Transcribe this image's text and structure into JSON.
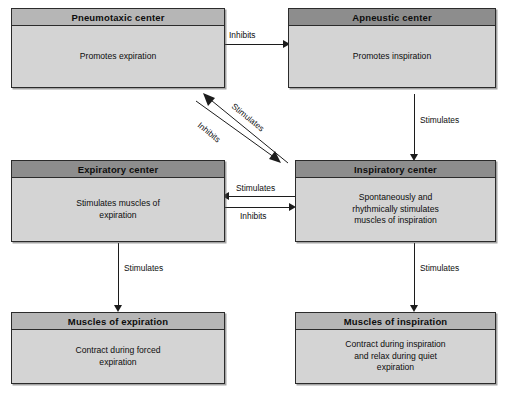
{
  "diagram": {
    "colors": {
      "box_fill": "#d4d4d4",
      "header_light": "#b6b6b6",
      "header_dark": "#8d8d8d",
      "border": "#2b2b2b",
      "line": "#1c1c1c",
      "background": "#ffffff"
    },
    "nodes": [
      {
        "id": "pneumotaxic",
        "title": "Pneumotaxic center",
        "body": "Promotes expiration",
        "header_shade": "light"
      },
      {
        "id": "apneustic",
        "title": "Apneustic center",
        "body": "Promotes inspiration",
        "header_shade": "dark"
      },
      {
        "id": "expiratory",
        "title": "Expiratory center",
        "body": "Stimulates muscles of\nexpiration",
        "header_shade": "dark"
      },
      {
        "id": "inspiratory",
        "title": "Inspiratory center",
        "body": "Spontaneously and\nrhythmically stimulates\nmuscles of inspiration",
        "header_shade": "dark"
      },
      {
        "id": "muscles-expiration",
        "title": "Muscles of expiration",
        "body": "Contract during forced\nexpiration",
        "header_shade": "light"
      },
      {
        "id": "muscles-inspiration",
        "title": "Muscles of inspiration",
        "body": "Contract during inspiration\nand relax during quiet\nexpiration",
        "header_shade": "light"
      }
    ],
    "edges": [
      {
        "id": "pneumotaxic-to-apneustic",
        "label": "Inhibits",
        "from": "pneumotaxic",
        "to": "apneustic",
        "direction": "right"
      },
      {
        "id": "apneustic-to-inspiratory",
        "label": "Stimulates",
        "from": "apneustic",
        "to": "inspiratory",
        "direction": "down"
      },
      {
        "id": "inspiratory-to-pneumotaxic",
        "label": "Stimulates",
        "from": "inspiratory",
        "to": "pneumotaxic",
        "direction": "diagonal-up-left"
      },
      {
        "id": "pneumotaxic-to-inspiratory",
        "label": "Inhibits",
        "from": "pneumotaxic",
        "to": "inspiratory",
        "direction": "diagonal-down-right"
      },
      {
        "id": "inspiratory-to-expiratory",
        "label": "Stimulates",
        "from": "inspiratory",
        "to": "expiratory",
        "direction": "left"
      },
      {
        "id": "expiratory-to-inspiratory",
        "label": "Inhibits",
        "from": "expiratory",
        "to": "inspiratory",
        "direction": "right"
      },
      {
        "id": "expiratory-to-muscles",
        "label": "Stimulates",
        "from": "expiratory",
        "to": "muscles-expiration",
        "direction": "down"
      },
      {
        "id": "inspiratory-to-muscles",
        "label": "Stimulates",
        "from": "inspiratory",
        "to": "muscles-inspiration",
        "direction": "down"
      }
    ]
  }
}
